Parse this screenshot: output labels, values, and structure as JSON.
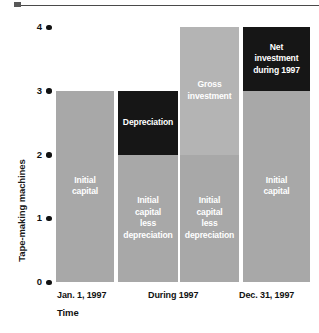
{
  "chart_data": {
    "type": "bar",
    "title": "",
    "subtitle": "",
    "xlabel": "Time",
    "ylabel": "Tape-making machines",
    "ylim": [
      0,
      4
    ],
    "yticks": [
      0,
      1,
      2,
      3,
      4
    ],
    "ytick_labels": [
      "0",
      "1",
      "2",
      "3",
      "4"
    ],
    "grid": false,
    "legend": "none",
    "categories": [
      "Jan. 1, 1997",
      "During 1997",
      "During 1997",
      "Dec. 31, 1997"
    ],
    "xtick_labels": [
      "Jan. 1, 1997",
      "During 1997",
      "Dec. 31, 1997"
    ],
    "stacked": true,
    "bars": [
      {
        "category": "Jan. 1, 1997",
        "total": 3,
        "segments": [
          {
            "label": "Initial\ncapital",
            "from": 0,
            "to": 3,
            "value": 3,
            "color": "#a8a8a8",
            "text_color": "#ffffff"
          }
        ]
      },
      {
        "category": "During 1997",
        "total": 3,
        "segments": [
          {
            "label": "Initial\ncapital\nless\ndepreciation",
            "from": 0,
            "to": 2,
            "value": 2,
            "color": "#a8a8a8",
            "text_color": "#ffffff"
          },
          {
            "label": "Depreciation",
            "from": 2,
            "to": 3,
            "value": 1,
            "color": "#161616",
            "text_color": "#ffffff"
          }
        ]
      },
      {
        "category": "During 1997",
        "total": 4,
        "segments": [
          {
            "label": "Initial\ncapital\nless\ndepreciation",
            "from": 0,
            "to": 2,
            "value": 2,
            "color": "#a8a8a8",
            "text_color": "#ffffff"
          },
          {
            "label": "Gross\ninvestment",
            "from": 2,
            "to": 4,
            "value": 2,
            "color": "#b4b4b4",
            "text_color": "#ffffff"
          }
        ]
      },
      {
        "category": "Dec. 31, 1997",
        "total": 4,
        "segments": [
          {
            "label": "Initial\ncapital",
            "from": 0,
            "to": 3,
            "value": 3,
            "color": "#a8a8a8",
            "text_color": "#ffffff"
          },
          {
            "label": "Net\ninvestment\nduring 1997",
            "from": 3,
            "to": 4,
            "value": 1,
            "color": "#161616",
            "text_color": "#ffffff"
          }
        ]
      }
    ],
    "colors": {
      "gray": "#a8a8a8",
      "gray_light": "#b4b4b4",
      "dark": "#161616",
      "axis_text": "#111111",
      "background": "#ffffff"
    }
  },
  "axis": {
    "y_title": "Tape-making machines",
    "x_title": "Time",
    "ticks": [
      {
        "label": "4"
      },
      {
        "label": "3"
      },
      {
        "label": "2"
      },
      {
        "label": "1"
      },
      {
        "label": "0"
      }
    ]
  },
  "xlabels": [
    {
      "text": "Jan. 1, 1997"
    },
    {
      "text": "During 1997"
    },
    {
      "text": "Dec. 31, 1997"
    }
  ],
  "caption": "",
  "segment_labels": {
    "initial_capital": "Initial\ncapital",
    "initial_capital_less_depreciation": "Initial\ncapital\nless\ndepreciation",
    "depreciation": "Depreciation",
    "gross_investment": "Gross\ninvestment",
    "net_investment": "Net\ninvestment\nduring 1997"
  }
}
